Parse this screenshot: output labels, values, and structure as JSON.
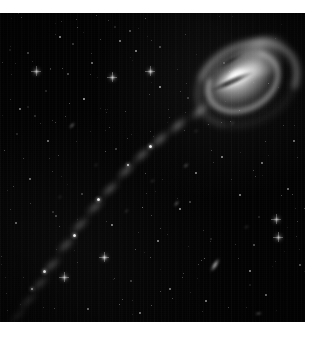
{
  "image": {
    "kind": "astronomical-photograph",
    "subject": "Tadpole Galaxy tidal tail",
    "palette": {
      "background": "#ffffff",
      "sky": "#020202",
      "starlight": "#ffffff",
      "nebulosity": "#d8d8d8",
      "galaxy_core": "#fdfdfd"
    },
    "plate": {
      "left": 0,
      "top": 13,
      "width": 305,
      "height": 309
    },
    "credit": "",
    "chart_data": {
      "type": "scatter",
      "title": "",
      "xlabel": "",
      "ylabel": "",
      "grid": false,
      "legend": "none",
      "xlim": [
        0,
        305
      ],
      "ylim": [
        0,
        309
      ],
      "annotations": [
        "Bright disturbed spiral galaxy at upper right",
        "Long narrow tidal tail sweeping to lower left",
        "Dense field of faint background galaxies and stars"
      ],
      "series": [
        {
          "name": "galaxy-head",
          "points": [
            {
              "x": 240,
              "y": 60,
              "size": 96,
              "brightness": 1.0
            }
          ]
        },
        {
          "name": "tidal-tail",
          "points": [
            {
              "x": 200,
              "y": 98,
              "size": 16,
              "brightness": 0.62
            },
            {
              "x": 178,
              "y": 112,
              "size": 15,
              "brightness": 0.58
            },
            {
              "x": 160,
              "y": 126,
              "size": 15,
              "brightness": 0.55
            },
            {
              "x": 142,
              "y": 142,
              "size": 14,
              "brightness": 0.52
            },
            {
              "x": 126,
              "y": 158,
              "size": 14,
              "brightness": 0.52
            },
            {
              "x": 110,
              "y": 176,
              "size": 14,
              "brightness": 0.5
            },
            {
              "x": 95,
              "y": 194,
              "size": 14,
              "brightness": 0.48
            },
            {
              "x": 80,
              "y": 212,
              "size": 14,
              "brightness": 0.46
            },
            {
              "x": 66,
              "y": 232,
              "size": 14,
              "brightness": 0.44
            },
            {
              "x": 52,
              "y": 252,
              "size": 14,
              "brightness": 0.42
            },
            {
              "x": 40,
              "y": 270,
              "size": 13,
              "brightness": 0.36
            },
            {
              "x": 28,
              "y": 288,
              "size": 12,
              "brightness": 0.28
            },
            {
              "x": 18,
              "y": 302,
              "size": 11,
              "brightness": 0.2
            }
          ]
        },
        {
          "name": "tail-knots",
          "points": [
            {
              "x": 150,
              "y": 133,
              "size": 3,
              "brightness": 0.95
            },
            {
              "x": 128,
              "y": 152,
              "size": 2,
              "brightness": 0.85
            },
            {
              "x": 98,
              "y": 186,
              "size": 3,
              "brightness": 0.9
            },
            {
              "x": 74,
              "y": 222,
              "size": 3,
              "brightness": 0.92
            },
            {
              "x": 44,
              "y": 258,
              "size": 3,
              "brightness": 0.88
            },
            {
              "x": 32,
              "y": 276,
              "size": 2,
              "brightness": 0.7
            }
          ]
        },
        {
          "name": "foreground-stars",
          "points": [
            {
              "x": 36,
              "y": 58,
              "size": 3,
              "brightness": 0.8
            },
            {
              "x": 60,
              "y": 24,
              "size": 2,
              "brightness": 0.55
            },
            {
              "x": 84,
              "y": 86,
              "size": 2,
              "brightness": 0.6
            },
            {
              "x": 112,
              "y": 64,
              "size": 3,
              "brightness": 0.85
            },
            {
              "x": 136,
              "y": 38,
              "size": 2,
              "brightness": 0.5
            },
            {
              "x": 150,
              "y": 58,
              "size": 3,
              "brightness": 0.9
            },
            {
              "x": 160,
              "y": 74,
              "size": 2,
              "brightness": 0.55
            },
            {
              "x": 120,
              "y": 28,
              "size": 2,
              "brightness": 0.45
            },
            {
              "x": 92,
              "y": 50,
              "size": 2,
              "brightness": 0.4
            },
            {
              "x": 20,
              "y": 96,
              "size": 2,
              "brightness": 0.45
            },
            {
              "x": 48,
              "y": 128,
              "size": 2,
              "brightness": 0.42
            },
            {
              "x": 30,
              "y": 166,
              "size": 2,
              "brightness": 0.4
            },
            {
              "x": 16,
              "y": 210,
              "size": 2,
              "brightness": 0.38
            },
            {
              "x": 64,
              "y": 264,
              "size": 3,
              "brightness": 0.75
            },
            {
              "x": 104,
              "y": 244,
              "size": 3,
              "brightness": 0.95
            },
            {
              "x": 112,
              "y": 212,
              "size": 2,
              "brightness": 0.5
            },
            {
              "x": 158,
              "y": 228,
              "size": 2,
              "brightness": 0.48
            },
            {
              "x": 180,
              "y": 196,
              "size": 2,
              "brightness": 0.52
            },
            {
              "x": 196,
              "y": 160,
              "size": 2,
              "brightness": 0.46
            },
            {
              "x": 222,
              "y": 144,
              "size": 2,
              "brightness": 0.5
            },
            {
              "x": 240,
              "y": 182,
              "size": 2,
              "brightness": 0.48
            },
            {
              "x": 262,
              "y": 150,
              "size": 2,
              "brightness": 0.44
            },
            {
              "x": 276,
              "y": 206,
              "size": 3,
              "brightness": 0.7
            },
            {
              "x": 278,
              "y": 224,
              "size": 3,
              "brightness": 0.72
            },
            {
              "x": 288,
              "y": 176,
              "size": 2,
              "brightness": 0.42
            },
            {
              "x": 250,
              "y": 258,
              "size": 2,
              "brightness": 0.48
            },
            {
              "x": 206,
              "y": 288,
              "size": 2,
              "brightness": 0.46
            },
            {
              "x": 170,
              "y": 276,
              "size": 2,
              "brightness": 0.44
            },
            {
              "x": 140,
              "y": 300,
              "size": 2,
              "brightness": 0.42
            },
            {
              "x": 88,
              "y": 296,
              "size": 2,
              "brightness": 0.4
            },
            {
              "x": 266,
              "y": 282,
              "size": 2,
              "brightness": 0.44
            },
            {
              "x": 294,
              "y": 128,
              "size": 2,
              "brightness": 0.4
            },
            {
              "x": 300,
              "y": 252,
              "size": 2,
              "brightness": 0.38
            }
          ]
        },
        {
          "name": "background-galaxies",
          "points": [
            {
              "x": 215,
              "y": 252,
              "size": 18,
              "angle": -58,
              "brightness": 0.85
            },
            {
              "x": 72,
              "y": 112,
              "size": 10,
              "angle": -48,
              "brightness": 0.6
            },
            {
              "x": 176,
              "y": 190,
              "size": 9,
              "angle": -50,
              "brightness": 0.55
            },
            {
              "x": 186,
              "y": 152,
              "size": 8,
              "angle": -40,
              "brightness": 0.5
            },
            {
              "x": 152,
              "y": 168,
              "size": 7,
              "angle": -35,
              "brightness": 0.45
            },
            {
              "x": 126,
              "y": 198,
              "size": 7,
              "angle": -55,
              "brightness": 0.45
            },
            {
              "x": 246,
              "y": 214,
              "size": 7,
              "angle": -30,
              "brightness": 0.42
            },
            {
              "x": 232,
              "y": 110,
              "size": 7,
              "angle": -62,
              "brightness": 0.42
            },
            {
              "x": 60,
              "y": 184,
              "size": 6,
              "angle": -45,
              "brightness": 0.38
            },
            {
              "x": 96,
              "y": 152,
              "size": 6,
              "angle": -50,
              "brightness": 0.38
            },
            {
              "x": 196,
              "y": 118,
              "size": 6,
              "angle": -20,
              "brightness": 0.4
            },
            {
              "x": 258,
              "y": 300,
              "size": 9,
              "angle": -10,
              "brightness": 0.5
            }
          ]
        }
      ]
    }
  }
}
